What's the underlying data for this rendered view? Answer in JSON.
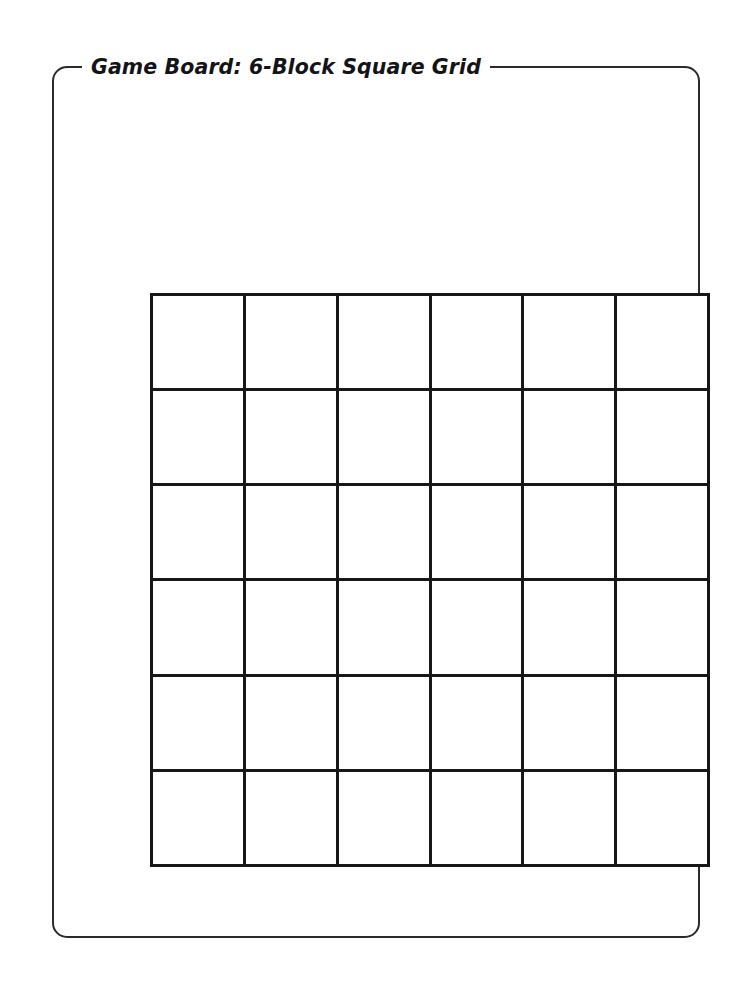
{
  "page": {
    "background_color": "#ffffff",
    "width": 737,
    "height": 1006
  },
  "board": {
    "legend": "Game Board: 6-Block Square Grid",
    "frame_border_color": "#2b2b2f",
    "grid_line_color": "#17171a",
    "cell_fill_color": "#ffffff"
  },
  "grid": {
    "rows": 6,
    "columns": 6,
    "total_cells": 36,
    "cells": [
      [
        "",
        "",
        "",
        "",
        "",
        ""
      ],
      [
        "",
        "",
        "",
        "",
        "",
        ""
      ],
      [
        "",
        "",
        "",
        "",
        "",
        ""
      ],
      [
        "",
        "",
        "",
        "",
        "",
        ""
      ],
      [
        "",
        "",
        "",
        "",
        "",
        ""
      ],
      [
        "",
        "",
        "",
        "",
        "",
        ""
      ]
    ]
  }
}
